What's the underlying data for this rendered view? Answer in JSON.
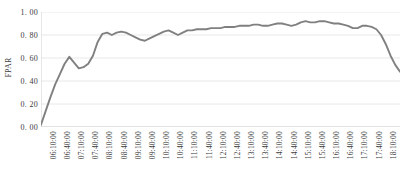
{
  "chart_data": {
    "type": "line",
    "title": "",
    "xlabel": "",
    "ylabel": "FPAR",
    "ylim": [
      0.0,
      1.0
    ],
    "yticks": [
      0.0,
      0.2,
      0.4,
      0.6,
      0.8,
      1.0
    ],
    "ytick_labels": [
      "0. 00",
      "0. 20",
      "0. 40",
      "0. 60",
      "0. 80",
      "1. 00"
    ],
    "grid": true,
    "legend": "none",
    "line_color": "#808080",
    "gridline_color": "#e8e8e8",
    "axis_color": "#d9d9d9",
    "background_color": "#ffffff",
    "xtick_labels": [
      "06:10:00",
      "06:40:00",
      "07:10:00",
      "07:40:00",
      "08:10:00",
      "08:40:00",
      "09:10:00",
      "09:40:00",
      "10:10:00",
      "10:40:00",
      "11:10:00",
      "11:40:00",
      "12:10:00",
      "12:40:00",
      "13:10:00",
      "13:40:00",
      "14:10:00",
      "14:40:00",
      "15:10:00",
      "15:40:00",
      "16:10:00",
      "16:40:00",
      "17:10:00",
      "17:40:00",
      "18:10:00",
      "18:40:00"
    ],
    "x": [
      "06:00:00",
      "06:10:00",
      "06:20:00",
      "06:30:00",
      "06:40:00",
      "06:50:00",
      "07:00:00",
      "07:10:00",
      "07:20:00",
      "07:30:00",
      "07:40:00",
      "07:50:00",
      "08:00:00",
      "08:10:00",
      "08:20:00",
      "08:30:00",
      "08:40:00",
      "08:50:00",
      "09:00:00",
      "09:10:00",
      "09:20:00",
      "09:30:00",
      "09:40:00",
      "09:50:00",
      "10:00:00",
      "10:10:00",
      "10:20:00",
      "10:30:00",
      "10:40:00",
      "10:50:00",
      "11:00:00",
      "11:10:00",
      "11:20:00",
      "11:30:00",
      "11:40:00",
      "11:50:00",
      "12:00:00",
      "12:10:00",
      "12:20:00",
      "12:30:00",
      "12:40:00",
      "12:50:00",
      "13:00:00",
      "13:10:00",
      "13:20:00",
      "13:30:00",
      "13:40:00",
      "13:50:00",
      "14:00:00",
      "14:10:00",
      "14:20:00",
      "14:30:00",
      "14:40:00",
      "14:50:00",
      "15:00:00",
      "15:10:00",
      "15:20:00",
      "15:30:00",
      "15:40:00",
      "15:50:00",
      "16:00:00",
      "16:10:00",
      "16:20:00",
      "16:30:00",
      "16:40:00",
      "16:50:00",
      "17:00:00",
      "17:10:00",
      "17:20:00",
      "17:30:00",
      "17:40:00",
      "17:50:00",
      "18:00:00",
      "18:10:00",
      "18:20:00",
      "18:30:00",
      "18:40:00"
    ],
    "values": [
      0.02,
      0.14,
      0.26,
      0.37,
      0.46,
      0.55,
      0.61,
      0.56,
      0.51,
      0.52,
      0.55,
      0.62,
      0.74,
      0.81,
      0.82,
      0.8,
      0.82,
      0.83,
      0.82,
      0.8,
      0.78,
      0.76,
      0.75,
      0.77,
      0.79,
      0.81,
      0.83,
      0.84,
      0.82,
      0.8,
      0.82,
      0.84,
      0.84,
      0.85,
      0.85,
      0.85,
      0.86,
      0.86,
      0.86,
      0.87,
      0.87,
      0.87,
      0.88,
      0.88,
      0.88,
      0.89,
      0.89,
      0.88,
      0.88,
      0.89,
      0.9,
      0.9,
      0.89,
      0.88,
      0.89,
      0.91,
      0.92,
      0.91,
      0.91,
      0.92,
      0.92,
      0.91,
      0.9,
      0.9,
      0.89,
      0.88,
      0.86,
      0.86,
      0.88,
      0.88,
      0.87,
      0.85,
      0.8,
      0.72,
      0.62,
      0.54,
      0.48
    ],
    "series_name": "FPAR"
  }
}
